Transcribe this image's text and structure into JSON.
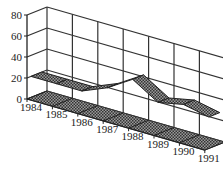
{
  "chart_data": {
    "type": "area",
    "style": "3d-ribbon",
    "title": "",
    "xlabel": "",
    "ylabel": "",
    "categories": [
      "1984",
      "1985",
      "1986",
      "1987",
      "1988",
      "1989",
      "1990",
      "1991"
    ],
    "series": [
      {
        "name": "Series 1",
        "values": [
          20,
          20,
          20,
          30,
          45,
          30,
          35,
          30
        ]
      }
    ],
    "yticks": [
      "0",
      "20",
      "40",
      "60",
      "80"
    ],
    "ylim": [
      0,
      80
    ],
    "grid": true,
    "legend": "none"
  },
  "colors": {
    "grid": "#333333",
    "ribbon": "#555555",
    "floor": "#777777",
    "background": "#ffffff"
  }
}
